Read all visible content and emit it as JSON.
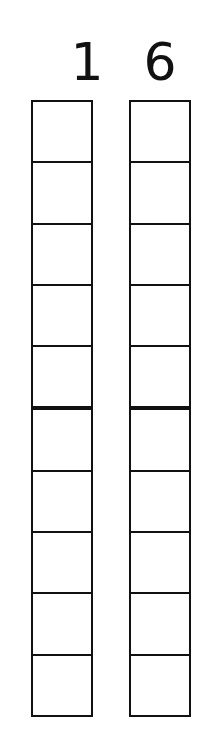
{
  "diagram": {
    "type": "place-value-columns",
    "columns": [
      {
        "digit": "1",
        "boxes": 10,
        "divider_after": 5
      },
      {
        "digit": "6",
        "boxes": 10,
        "divider_after": 5
      }
    ]
  }
}
